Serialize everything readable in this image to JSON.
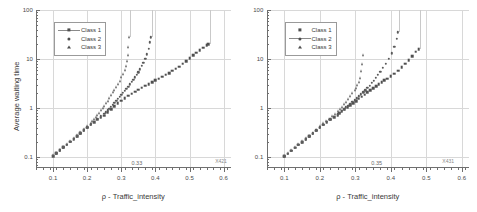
{
  "figure": {
    "panel_count": 2,
    "background": "#ffffff",
    "marker_color": "#4f4f4f",
    "grid_color": "#d8d8d8",
    "axis_color": "#6f6f6f"
  },
  "chart_data": [
    {
      "type": "scatter",
      "title": "",
      "xlabel": "ρ - Traffic_intensity",
      "ylabel": "Average waiting time",
      "xlim": [
        0.05,
        0.62
      ],
      "ylim": [
        0.06,
        100
      ],
      "yscale": "log",
      "xscale": "linear",
      "grid": true,
      "legend_position": "upper-left",
      "xticks": [
        0.1,
        0.2,
        0.3,
        0.4,
        0.5,
        0.6
      ],
      "xticklabels": [
        "0.1",
        "0.2",
        "0.3",
        "0.4",
        "0.5",
        "0.6"
      ],
      "yticks": [
        0.1,
        1,
        10,
        100
      ],
      "yticklabels": [
        "0.1",
        "1",
        "10",
        "100"
      ],
      "annotations": [
        {
          "text": "0.33",
          "x": 0.33,
          "y": 0.072
        },
        {
          "text": "X421",
          "x": 0.575,
          "y": 0.078
        }
      ],
      "series": [
        {
          "name": "Class 1",
          "marker": "square",
          "x": [
            0.1,
            0.11,
            0.12,
            0.13,
            0.14,
            0.15,
            0.16,
            0.17,
            0.18,
            0.19,
            0.2,
            0.21,
            0.22,
            0.23,
            0.24,
            0.25,
            0.26,
            0.27,
            0.28,
            0.29,
            0.3,
            0.31,
            0.32,
            0.33,
            0.34,
            0.35,
            0.36,
            0.37,
            0.38,
            0.39,
            0.4,
            0.41,
            0.42,
            0.43,
            0.44,
            0.45,
            0.46,
            0.47,
            0.48,
            0.49,
            0.5,
            0.51,
            0.52,
            0.53,
            0.54,
            0.55,
            0.555
          ],
          "y": [
            0.105,
            0.12,
            0.138,
            0.158,
            0.18,
            0.205,
            0.235,
            0.268,
            0.305,
            0.35,
            0.4,
            0.46,
            0.52,
            0.58,
            0.64,
            0.7,
            0.82,
            0.96,
            1.1,
            1.25,
            1.42,
            1.6,
            1.78,
            1.95,
            2.15,
            2.35,
            2.6,
            2.85,
            3.1,
            3.4,
            3.7,
            4.0,
            4.4,
            4.8,
            5.2,
            5.8,
            6.3,
            7.0,
            8.0,
            9.0,
            10.5,
            12.0,
            13.5,
            15.0,
            17.0,
            19.0,
            20.0
          ]
        },
        {
          "name": "Class 2",
          "marker": "circle",
          "x": [
            0.1,
            0.11,
            0.12,
            0.13,
            0.14,
            0.15,
            0.16,
            0.17,
            0.18,
            0.19,
            0.2,
            0.21,
            0.22,
            0.23,
            0.24,
            0.25,
            0.255,
            0.26,
            0.265,
            0.27,
            0.275,
            0.28,
            0.285,
            0.29,
            0.295,
            0.3,
            0.305,
            0.31,
            0.315,
            0.32,
            0.325,
            0.33,
            0.335,
            0.34,
            0.345,
            0.35,
            0.355,
            0.36,
            0.365,
            0.37,
            0.375,
            0.38,
            0.383,
            0.386
          ],
          "y": [
            0.105,
            0.12,
            0.138,
            0.158,
            0.18,
            0.205,
            0.235,
            0.268,
            0.305,
            0.352,
            0.405,
            0.465,
            0.525,
            0.6,
            0.68,
            0.76,
            0.82,
            0.9,
            0.98,
            1.07,
            1.17,
            1.28,
            1.4,
            1.53,
            1.68,
            1.85,
            2.05,
            2.25,
            2.5,
            2.75,
            3.05,
            3.4,
            3.8,
            4.25,
            4.8,
            5.4,
            6.2,
            7.2,
            8.5,
            10.2,
            12.5,
            16.0,
            22.0,
            28.0
          ]
        },
        {
          "name": "Class 3",
          "marker": "triangle",
          "x": [
            0.1,
            0.11,
            0.12,
            0.13,
            0.14,
            0.15,
            0.16,
            0.17,
            0.18,
            0.19,
            0.2,
            0.21,
            0.215,
            0.22,
            0.225,
            0.23,
            0.235,
            0.24,
            0.245,
            0.25,
            0.255,
            0.26,
            0.265,
            0.27,
            0.275,
            0.28,
            0.285,
            0.29,
            0.295,
            0.3,
            0.305,
            0.31,
            0.313,
            0.316,
            0.319,
            0.321,
            0.323
          ],
          "y": [
            0.108,
            0.123,
            0.141,
            0.162,
            0.185,
            0.212,
            0.243,
            0.278,
            0.32,
            0.37,
            0.43,
            0.5,
            0.545,
            0.6,
            0.66,
            0.73,
            0.81,
            0.9,
            1.0,
            1.12,
            1.26,
            1.42,
            1.6,
            1.82,
            2.08,
            2.38,
            2.72,
            3.15,
            3.65,
            4.25,
            5.0,
            6.0,
            7.2,
            9.0,
            12.0,
            17.5,
            28.0
          ]
        }
      ]
    },
    {
      "type": "scatter",
      "title": "",
      "xlabel": "ρ - Traffic_intensity",
      "ylabel": "",
      "xlim": [
        0.05,
        0.62
      ],
      "ylim": [
        0.06,
        100
      ],
      "yscale": "log",
      "xscale": "linear",
      "grid": true,
      "legend_position": "upper-left",
      "xticks": [
        0.1,
        0.2,
        0.3,
        0.4,
        0.5,
        0.6
      ],
      "xticklabels": [
        "0.1",
        "0.2",
        "0.3",
        "0.4",
        "0.5",
        "0.6"
      ],
      "yticks": [
        0.1,
        1,
        10,
        100
      ],
      "yticklabels": [
        "0.1",
        "1",
        "10",
        "100"
      ],
      "annotations": [
        {
          "text": "0.35",
          "x": 0.345,
          "y": 0.072
        },
        {
          "text": "X431",
          "x": 0.545,
          "y": 0.078
        }
      ],
      "series": [
        {
          "name": "Class 1",
          "marker": "square",
          "x": [
            0.1,
            0.11,
            0.12,
            0.13,
            0.14,
            0.15,
            0.16,
            0.17,
            0.18,
            0.19,
            0.2,
            0.21,
            0.22,
            0.23,
            0.24,
            0.25,
            0.255,
            0.262,
            0.27,
            0.278,
            0.286,
            0.294,
            0.302,
            0.31,
            0.318,
            0.326,
            0.334,
            0.342,
            0.35,
            0.358,
            0.366,
            0.374,
            0.382,
            0.39,
            0.4,
            0.41,
            0.42,
            0.43,
            0.44,
            0.45,
            0.46,
            0.47,
            0.478
          ],
          "y": [
            0.103,
            0.118,
            0.135,
            0.155,
            0.178,
            0.202,
            0.232,
            0.265,
            0.302,
            0.348,
            0.4,
            0.455,
            0.515,
            0.58,
            0.65,
            0.72,
            0.78,
            0.86,
            0.95,
            1.04,
            1.15,
            1.27,
            1.4,
            1.55,
            1.7,
            1.88,
            2.08,
            2.3,
            2.55,
            2.82,
            3.1,
            3.4,
            3.7,
            4.0,
            4.5,
            5.0,
            5.8,
            6.8,
            8.0,
            9.5,
            11.5,
            14.0,
            16.0
          ]
        },
        {
          "name": "Class 2",
          "marker": "circle",
          "x": [
            0.1,
            0.11,
            0.12,
            0.13,
            0.14,
            0.15,
            0.16,
            0.17,
            0.18,
            0.19,
            0.2,
            0.21,
            0.22,
            0.23,
            0.24,
            0.25,
            0.256,
            0.262,
            0.268,
            0.274,
            0.28,
            0.286,
            0.292,
            0.298,
            0.304,
            0.31,
            0.316,
            0.322,
            0.328,
            0.334,
            0.34,
            0.346,
            0.352,
            0.358,
            0.364,
            0.37,
            0.378,
            0.386,
            0.394,
            0.402,
            0.41,
            0.416,
            0.42
          ],
          "y": [
            0.103,
            0.118,
            0.135,
            0.155,
            0.178,
            0.202,
            0.232,
            0.266,
            0.304,
            0.35,
            0.402,
            0.46,
            0.52,
            0.59,
            0.665,
            0.74,
            0.8,
            0.87,
            0.95,
            1.03,
            1.12,
            1.22,
            1.33,
            1.45,
            1.58,
            1.73,
            1.9,
            2.1,
            2.32,
            2.58,
            2.88,
            3.25,
            3.65,
            4.15,
            4.75,
            5.5,
            6.6,
            8.0,
            10.0,
            13.0,
            18.0,
            26.0,
            35.0
          ]
        },
        {
          "name": "Class 3",
          "marker": "triangle",
          "x": [
            0.1,
            0.11,
            0.12,
            0.13,
            0.14,
            0.15,
            0.16,
            0.17,
            0.18,
            0.19,
            0.2,
            0.21,
            0.218,
            0.226,
            0.234,
            0.242,
            0.25,
            0.256,
            0.262,
            0.268,
            0.274,
            0.28,
            0.286,
            0.292,
            0.298,
            0.302,
            0.306,
            0.31,
            0.314,
            0.317,
            0.32,
            0.322
          ],
          "y": [
            0.106,
            0.121,
            0.139,
            0.16,
            0.183,
            0.21,
            0.24,
            0.275,
            0.316,
            0.365,
            0.425,
            0.49,
            0.545,
            0.61,
            0.685,
            0.77,
            0.87,
            0.96,
            1.07,
            1.2,
            1.35,
            1.53,
            1.74,
            2.0,
            2.32,
            2.6,
            2.95,
            3.4,
            4.2,
            5.8,
            8.0,
            12.0
          ]
        }
      ]
    }
  ]
}
